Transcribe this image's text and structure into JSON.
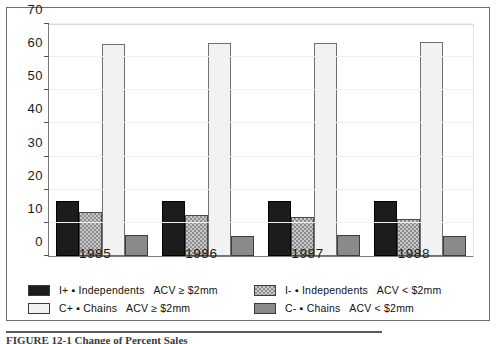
{
  "chart_data": {
    "type": "bar",
    "title": "",
    "xlabel": "",
    "ylabel": "",
    "categories": [
      "1985",
      "1986",
      "1987",
      "1988"
    ],
    "ylim": [
      0,
      70
    ],
    "yticks": [
      0,
      10,
      20,
      30,
      40,
      50,
      60,
      70
    ],
    "grid": false,
    "legend_position": "bottom",
    "series": [
      {
        "name": "I+ ▪ Independents  ACV ≥ $2mm",
        "key": "ip",
        "values": [
          16.5,
          16.5,
          16.7,
          16.6
        ]
      },
      {
        "name": "I- ▪ Independents  ACV < $2mm",
        "key": "im",
        "values": [
          13.2,
          12.4,
          11.7,
          11.2
        ]
      },
      {
        "name": "C+ ▪ Chains  ACV ≥ $2mm",
        "key": "cp",
        "values": [
          64.0,
          64.4,
          64.4,
          64.5
        ]
      },
      {
        "name": "C- ▪ Chains  ACV < $2mm",
        "key": "cm",
        "values": [
          6.2,
          6.1,
          6.2,
          6.1
        ]
      }
    ]
  },
  "axis": {
    "y_labels": [
      "70",
      "60",
      "50",
      "40",
      "30",
      "20",
      "10",
      "0"
    ],
    "x_labels": [
      "1985",
      "1986",
      "1987",
      "1988"
    ]
  },
  "legend": {
    "items": [
      {
        "key": "ip",
        "code": "I+",
        "bullet": "▪",
        "name": "Independents",
        "metric": "ACV",
        "op": "≥",
        "value": "$2mm",
        "text": "I+ ▪ Independents   ACV ≥ $2mm"
      },
      {
        "key": "im",
        "code": "I-",
        "bullet": "▪",
        "name": "Independents",
        "metric": "ACV",
        "op": "<",
        "value": "$2mm",
        "text": "I- ▪ Independents   ACV < $2mm"
      },
      {
        "key": "cp",
        "code": "C+",
        "bullet": "▪",
        "name": "Chains",
        "metric": "ACV",
        "op": "≥",
        "value": "$2mm",
        "text": "C+ ▪ Chains   ACV ≥ $2mm"
      },
      {
        "key": "cm",
        "code": "C-",
        "bullet": "▪",
        "name": "Chains",
        "metric": "ACV",
        "op": "<",
        "value": "$2mm",
        "text": "C- ▪ Chains   ACV < $2mm"
      }
    ]
  },
  "caption": {
    "text": "FIGURE 12-1   Change of Percent Sales"
  },
  "colors": {
    "ip_fill": "#1c1c1c",
    "im_fill": "#c9c9c9",
    "cp_fill": "#f2f2f2",
    "cm_fill": "#8a8a8a",
    "axis": "#7a7a7a",
    "text": "#111111"
  }
}
